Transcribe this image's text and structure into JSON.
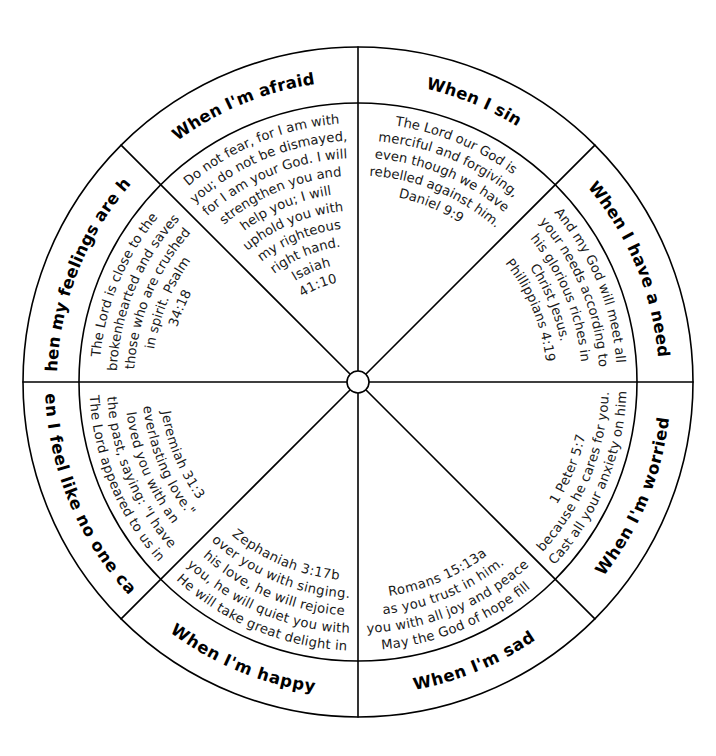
{
  "page": {
    "background_color": "#ffffff",
    "line_color": "#000000",
    "text_color": "#1a1a1a"
  },
  "wheel": {
    "center_x": 358,
    "center_y": 382,
    "outer_radius": 335,
    "inner_radius": 279,
    "hub_radius": 11,
    "segment_count": 8,
    "hub_label": ""
  },
  "segments": [
    {
      "id": "when-i-sin",
      "heading": "When I sin",
      "verse_lines": [
        "The Lord our God is",
        "merciful and forgiving,",
        "even though we have",
        "rebelled against him.",
        "Daniel 9:9"
      ],
      "verse_text": "The Lord our God is merciful and forgiving, even though we have rebelled against him.",
      "reference": "Daniel 9:9",
      "start_angle": -90,
      "end_angle": -45
    },
    {
      "id": "when-i-have-a-need",
      "heading": "When I have a need",
      "verse_lines": [
        "And my God will meet all",
        "your needs according to",
        "his glorious riches in",
        "Christ Jesus.",
        "Phillippians 4:19"
      ],
      "verse_text": "And my God will meet all your needs according to his glorious riches in Christ Jesus.",
      "reference": "Phillippians 4:19",
      "start_angle": -45,
      "end_angle": 0
    },
    {
      "id": "when-im-worried",
      "heading": "When I'm worried",
      "verse_lines": [
        "Cast all your anxiety on him",
        "because he cares for you.",
        "1 Peter 5:7"
      ],
      "verse_text": "Cast all your anxiety on him because he cares for you.",
      "reference": "1 Peter 5:7",
      "start_angle": 0,
      "end_angle": 45
    },
    {
      "id": "when-im-sad",
      "heading": "When I'm sad",
      "verse_lines": [
        "May the God of hope fill",
        "you with all joy and peace",
        "as you trust in him.",
        "Romans 15:13a"
      ],
      "verse_text": "May the God of hope fill you with all joy and peace as you trust in him.",
      "reference": "Romans 15:13a",
      "start_angle": 45,
      "end_angle": 90
    },
    {
      "id": "when-im-happy",
      "heading": "When I'm happy",
      "verse_lines": [
        "He will take great delight in",
        "you, he will quiet you with",
        "his love, he will rejoice",
        "over you with singing.",
        "Zephaniah 3:17b"
      ],
      "verse_text": "He will take great delight in you, he will quiet you with his love, he will rejoice over you with singing.",
      "reference": "Zephaniah 3:17b",
      "start_angle": 90,
      "end_angle": 135
    },
    {
      "id": "when-i-feel-like-no-one-cares",
      "heading": "When I feel like no one cares",
      "verse_lines": [
        "The Lord appeared to us in",
        "the past, saying: \"I have",
        "loved you with an",
        "everlasting love.\"",
        "Jeremiah 31:3"
      ],
      "verse_text": "The Lord appeared to us in the past, saying: \"I have loved you with an everlasting love.\"",
      "reference": "Jeremiah 31:3",
      "start_angle": 135,
      "end_angle": 180
    },
    {
      "id": "when-my-feelings-are-hurt",
      "heading": "When my feelings are hurt",
      "verse_lines": [
        "The Lord is close to the",
        "brokenhearted and saves",
        "those who are crushed",
        "in spirit.  Psalm",
        "34:18"
      ],
      "verse_text": "The Lord is close to the brokenhearted and saves those who are crushed in spirit.",
      "reference": "Psalm 34:18",
      "start_angle": 180,
      "end_angle": 225
    },
    {
      "id": "when-im-afraid",
      "heading": "When I'm afraid",
      "verse_lines": [
        "Do not fear, for I am with",
        "you; do not be dismayed,",
        "for I am your God.  I will",
        "strengthen you and",
        "help you; I will",
        "uphold you with",
        "my righteous",
        "right hand.",
        "Isaiah",
        "41:10"
      ],
      "verse_text": "Do not fear, for I am with you; do not be dismayed, for I am your God. I will strengthen you and help you; I will uphold you with my righteous right hand.",
      "reference": "Isaiah 41:10",
      "start_angle": 225,
      "end_angle": 270
    }
  ]
}
